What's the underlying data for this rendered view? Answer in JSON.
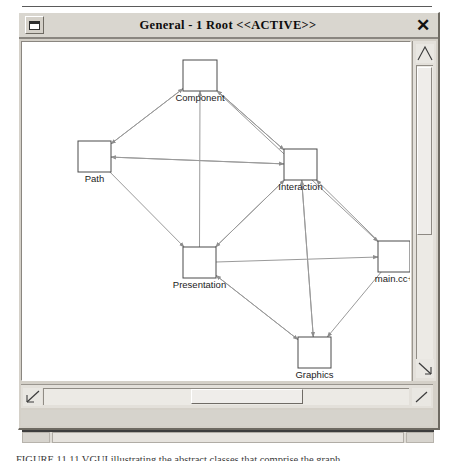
{
  "window": {
    "title": "General - 1 Root  <<ACTIVE>>",
    "menu_button_icon": "window-menu-icon",
    "close_button_label": "✕"
  },
  "scrollbars": {
    "vertical": {
      "up_arrow_icon": "scroll-up-arrow-icon",
      "down_arrow_icon": "scroll-down-arrow-icon",
      "thumb_label": ""
    },
    "horizontal": {
      "left_arrow_icon": "scroll-left-arrow-icon",
      "right_arrow_icon": "scroll-right-arrow-icon",
      "thumb_label": ""
    }
  },
  "graph": {
    "nodes": [
      {
        "id": "component",
        "label": "Component",
        "x": 163,
        "y": 46,
        "w": 34,
        "h": 31
      },
      {
        "id": "path",
        "label": "Path",
        "x": 58,
        "y": 127,
        "w": 33,
        "h": 31
      },
      {
        "id": "interaction",
        "label": "Interaction",
        "x": 264,
        "y": 135,
        "w": 33,
        "h": 31
      },
      {
        "id": "presentation",
        "label": "Presentation",
        "x": 163,
        "y": 233,
        "w": 33,
        "h": 31
      },
      {
        "id": "maincc",
        "label": "main.cc+",
        "x": 358,
        "y": 227,
        "w": 32,
        "h": 31
      },
      {
        "id": "graphics",
        "label": "Graphics",
        "x": 278,
        "y": 323,
        "w": 33,
        "h": 31
      }
    ],
    "edges": [
      {
        "from": "path",
        "to": "component"
      },
      {
        "from": "interaction",
        "to": "component"
      },
      {
        "from": "presentation",
        "to": "component"
      },
      {
        "from": "path",
        "to": "presentation"
      },
      {
        "from": "interaction",
        "to": "presentation"
      },
      {
        "from": "graphics",
        "to": "presentation"
      },
      {
        "from": "component",
        "to": "path"
      },
      {
        "from": "interaction",
        "to": "path"
      },
      {
        "from": "component",
        "to": "interaction"
      },
      {
        "from": "path",
        "to": "interaction"
      },
      {
        "from": "presentation",
        "to": "interaction"
      },
      {
        "from": "graphics",
        "to": "interaction"
      },
      {
        "from": "maincc",
        "to": "interaction"
      },
      {
        "from": "presentation",
        "to": "graphics"
      },
      {
        "from": "interaction",
        "to": "graphics"
      },
      {
        "from": "maincc",
        "to": "graphics"
      },
      {
        "from": "component",
        "to": "maincc"
      },
      {
        "from": "presentation",
        "to": "maincc"
      }
    ]
  },
  "caption": {
    "text": "FIGURE 11.11   VGUI illustrating the abstract classes that comprise the graph"
  },
  "colors": {
    "window_face": "#d4d0c8",
    "titlebar": "#d9d6cf",
    "canvas": "#ffffff",
    "node_stroke": "#4a4a4a",
    "edge_stroke": "#9a9a9a",
    "text": "#1a1a1a"
  }
}
